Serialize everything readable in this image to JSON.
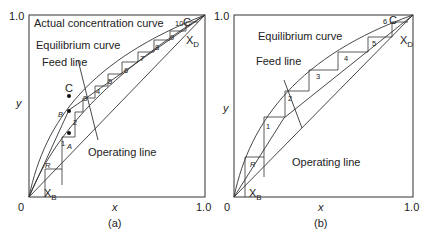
{
  "panels": [
    {
      "id": "a",
      "caption": "(a)",
      "axes": {
        "x_label": "x",
        "y_label": "y",
        "origin": "0",
        "x_max": "1.0",
        "y_max": "1.0"
      },
      "annotations": {
        "actual_curve": "Actual concentration curve",
        "equilibrium_curve": "Equilibrium curve",
        "feed_line": "Feed line",
        "operating_line": "Operating line",
        "x_b": "X",
        "x_b_sub": "B",
        "x_d": "X",
        "x_d_sub": "D",
        "point_c_top": "C",
        "point_c": "C",
        "point_b": "B",
        "point_a": "A",
        "reboiler": "R"
      },
      "stages": [
        "1",
        "2",
        "3",
        "4",
        "5",
        "6",
        "7",
        "8",
        "9",
        "10"
      ]
    },
    {
      "id": "b",
      "caption": "(b)",
      "axes": {
        "x_label": "x",
        "y_label": "y",
        "origin": "0",
        "x_max": "1.0",
        "y_max": "1.0"
      },
      "annotations": {
        "equilibrium_curve": "Equilibrium curve",
        "feed_line": "Feed line",
        "operating_line": "Operating line",
        "x_b": "X",
        "x_b_sub": "B",
        "x_d": "X",
        "x_d_sub": "D",
        "point_c_top": "C",
        "reboiler": "R"
      },
      "stages": [
        "1",
        "2",
        "3",
        "4",
        "5",
        "6"
      ]
    }
  ]
}
